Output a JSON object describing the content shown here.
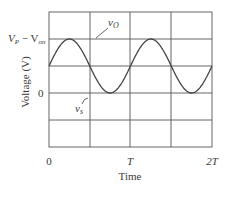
{
  "chart_data": {
    "type": "line",
    "title": "",
    "xlabel": "Time",
    "ylabel": "Voltage (V)",
    "x_ticks": [
      "0",
      "T",
      "2T"
    ],
    "y_ticks": [
      "0",
      "V_P − V_on"
    ],
    "y_tick_labels": {
      "zero": "0",
      "peak_main": "V",
      "peak_sub": "P",
      "peak_minus": " − V",
      "peak_sub2": "on"
    },
    "grid": true,
    "xlim": [
      0,
      2
    ],
    "ylim_units": [
      -2,
      2
    ],
    "series": [
      {
        "name": "v_O",
        "label_main": "v",
        "label_sub": "O",
        "description": "half-wave rectified output (positive half-cycles, amplitude V_P − V_on)",
        "amplitude": 1.5,
        "period": 1,
        "rectified": true
      },
      {
        "name": "v_s",
        "label_main": "v",
        "label_sub": "s",
        "description": "sinusoidal source voltage",
        "amplitude": 1.5,
        "period": 1,
        "rectified": false
      }
    ],
    "annotations": [
      "v_O points to output curve near peak",
      "v_s points to source curve near negative half-cycle"
    ]
  },
  "axes": {
    "xlabel": "Time",
    "ylabel": "Voltage (V)",
    "x_tick_0": "0",
    "x_tick_T": "T",
    "x_tick_2T": "2T",
    "y_tick_0": "0",
    "y_tick_peak_V": "V",
    "y_tick_peak_P": "P",
    "y_tick_peak_mid": " − V",
    "y_tick_peak_on": "on"
  },
  "legend": {
    "vo_main": "v",
    "vo_sub": "O",
    "vs_main": "v",
    "vs_sub": "s"
  }
}
